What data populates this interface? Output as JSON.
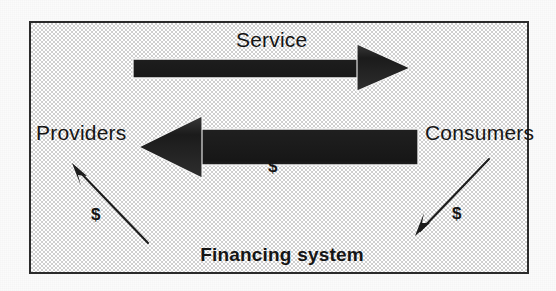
{
  "figure": {
    "caption_text": "Service",
    "frame": {
      "border_color": "#2b2b2b",
      "fill_color": "#dcdcdc"
    },
    "labels": {
      "service": "Service",
      "providers": "Providers",
      "consumers": "Consumers",
      "financing_system": "Financing system",
      "dollar_center": "$",
      "dollar_left": "$",
      "dollar_right": "$"
    },
    "arrows": [
      {
        "name": "service-arrow",
        "label": "Service",
        "from": "Providers",
        "to": "Consumers",
        "direction": "right",
        "style": "thick-block",
        "color": "#1c1c1c"
      },
      {
        "name": "payment-arrow",
        "label": "$",
        "from": "Consumers",
        "to": "Providers",
        "direction": "left",
        "style": "thick-block",
        "color": "#1c1c1c"
      },
      {
        "name": "financing-to-providers-arrow",
        "label": "$",
        "from": "Financing system",
        "to": "Providers",
        "direction": "up-left",
        "style": "thin-line",
        "color": "#1c1c1c"
      },
      {
        "name": "consumers-to-financing-arrow",
        "label": "$",
        "from": "Consumers",
        "to": "Financing system",
        "direction": "down-left",
        "style": "thin-line",
        "color": "#1c1c1c"
      }
    ]
  }
}
